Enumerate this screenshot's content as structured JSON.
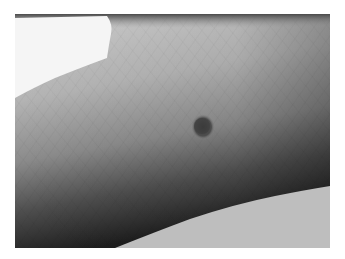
{
  "image": {
    "description": "Grayscale clinical photograph of skin on a finger/hand showing a small dark pigmented lesion (mole)",
    "subject": "pigmented skin lesion",
    "colors": {
      "page_background": "#ffffff",
      "top_left_background": "#f4f4f4",
      "bottom_right_background": "#bdbdbd",
      "skin_light": "#c8c8c8",
      "skin_mid": "#9c9c9c",
      "skin_dark": "#2a2a2a",
      "lesion": "#4a4a4a",
      "top_edge_shadow": "#5a5a5a"
    },
    "lesion_position": {
      "x": 203,
      "y": 127,
      "rx": 11,
      "ry": 12
    }
  }
}
